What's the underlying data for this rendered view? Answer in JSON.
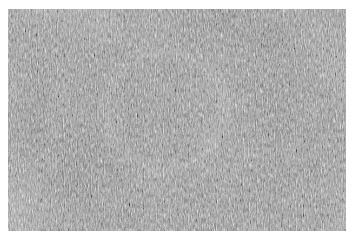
{
  "image": {
    "kind": "speckle-noise-image",
    "width": 355,
    "height": 242,
    "page_background": "#ffffff",
    "alt_text": "Grayscale speckle noise image with a faint circular ring pattern near the center"
  },
  "panel": {
    "name": "noise-panel",
    "left": 8,
    "top": 9,
    "width": 338,
    "height": 222,
    "base_gray": "#808080",
    "grain": {
      "character": "high-frequency speckle",
      "anisotropy": "vertical streaking",
      "base_frequency_x": 0.85,
      "base_frequency_y": 0.42,
      "octaves": 3,
      "vertical_stretch": 2.1,
      "contrast": "medium-high"
    },
    "mottle": {
      "base_frequency": 0.016,
      "octaves": 2,
      "opacity": 0.3
    }
  },
  "ring_feature": {
    "name": "faint-ring",
    "visible": true,
    "center_x": 165,
    "center_y": 110,
    "outer_radius": 68,
    "ring_radius": 58,
    "band_thickness": 18,
    "contrast": "very low",
    "polarity": "brighter than surround",
    "highlight_color": "#a6a6a6",
    "interior_color": "#7a7a7a"
  },
  "annotations": {
    "has_text": false,
    "has_axes": false,
    "has_legend": false,
    "has_scalebar": false,
    "labels": []
  }
}
